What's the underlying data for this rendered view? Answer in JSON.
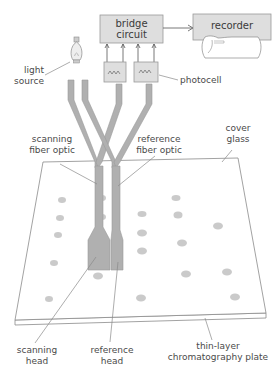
{
  "diagram": {
    "components": {
      "bridge_circuit": {
        "line1": "bridge",
        "line2": "circuit"
      },
      "recorder": {
        "label": "recorder"
      },
      "photocell": {
        "label": "photocell"
      },
      "light_source": {
        "line1": "light",
        "line2": "source"
      },
      "scanning_fiber_optic": {
        "line1": "scanning",
        "line2": "fiber optic"
      },
      "reference_fiber_optic": {
        "line1": "reference",
        "line2": "fiber optic"
      },
      "cover_glass": {
        "line1": "cover",
        "line2": "glass"
      },
      "scanning_head": {
        "line1": "scanning",
        "line2": "head"
      },
      "reference_head": {
        "line1": "reference",
        "line2": "head"
      },
      "tlc_plate": {
        "line1": "thin-layer",
        "line2": "chromatography plate"
      }
    },
    "colors": {
      "box_fill": "#dedede",
      "fiber_fill": "#b0b0b0",
      "line": "#8a8a8a",
      "text": "#4a4a4a"
    }
  }
}
